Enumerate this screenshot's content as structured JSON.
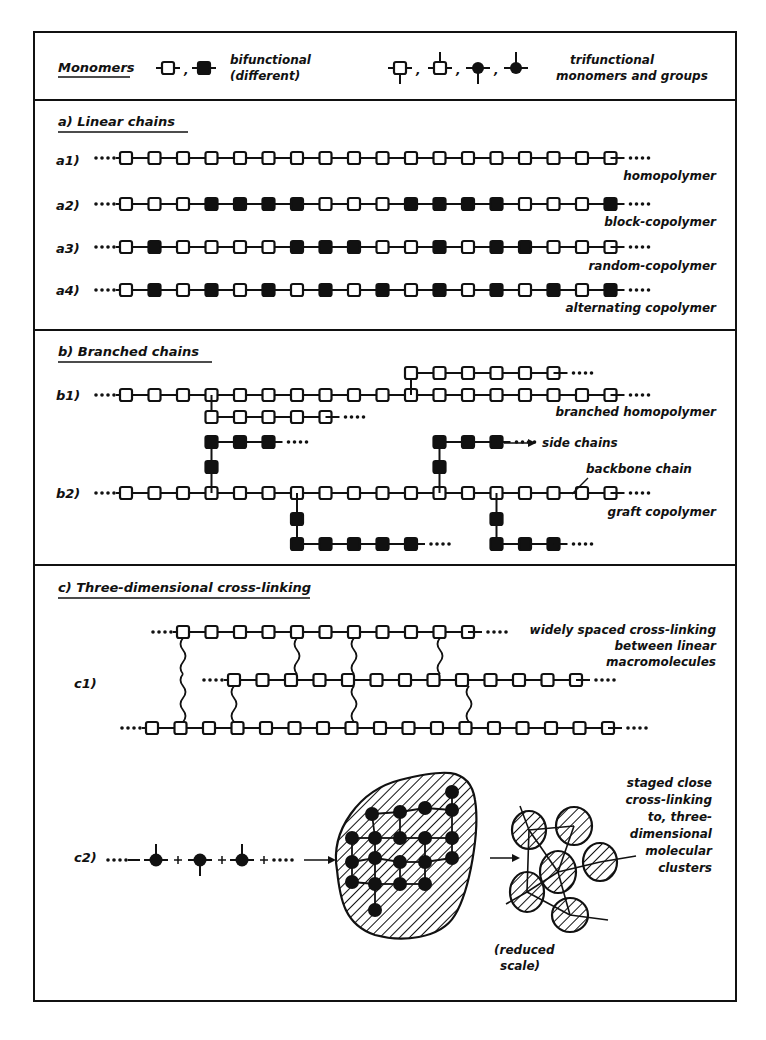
{
  "legend": {
    "title": "Monomers",
    "bifunctional_label_1": "bifunctional",
    "bifunctional_label_2": "(different)",
    "trifunctional_label_1": "trifunctional",
    "trifunctional_label_2": "monomers and groups",
    "separator": ","
  },
  "sections": {
    "a": {
      "title": "a)  Linear chains",
      "rows": [
        {
          "tag": "a1)",
          "name": "homopolymer",
          "pattern": "OOOOOOOOOOOOOOOOOO"
        },
        {
          "tag": "a2)",
          "name": "block-copolymer",
          "pattern": "OOOFFFFOOOFFFFOOOF"
        },
        {
          "tag": "a3)",
          "name": "random-copolymer",
          "pattern": "OFOOOOFFFOOFOFFOOO"
        },
        {
          "tag": "a4)",
          "name": "alternating copolymer",
          "pattern": "OFOFOFOFOFOFOFOFOF"
        }
      ]
    },
    "b": {
      "title": "b)  Branched chains",
      "b1": {
        "tag": "b1)",
        "name": "branched homopolymer",
        "backbone_count": 18,
        "branches": [
          {
            "at": 3,
            "dir": "down",
            "count": 5
          },
          {
            "at": 10,
            "dir": "up",
            "count": 6
          }
        ]
      },
      "b2": {
        "tag": "b2)",
        "name": "graft copolymer",
        "backbone_count": 18,
        "side_chains_label": "side chains",
        "backbone_label": "backbone chain",
        "grafts": [
          {
            "at": 3,
            "dir": "up",
            "count": 3
          },
          {
            "at": 11,
            "dir": "up",
            "count": 3
          },
          {
            "at": 6,
            "dir": "down",
            "count": 5
          },
          {
            "at": 13,
            "dir": "down",
            "count": 3
          }
        ]
      }
    },
    "c": {
      "title": "c)  Three-dimensional cross-linking",
      "c1": {
        "tag": "c1)",
        "label_lines": [
          "widely spaced cross-linking",
          "between linear",
          "macromolecules"
        ]
      },
      "c2": {
        "tag": "c2)",
        "label_lines": [
          "staged close",
          "cross-linking",
          "to, three-",
          "dimensional",
          "molecular",
          "clusters"
        ],
        "scale_note_1": "(reduced",
        "scale_note_2": "scale)"
      }
    }
  },
  "colors": {
    "ink": "#111111",
    "background": "#ffffff"
  }
}
